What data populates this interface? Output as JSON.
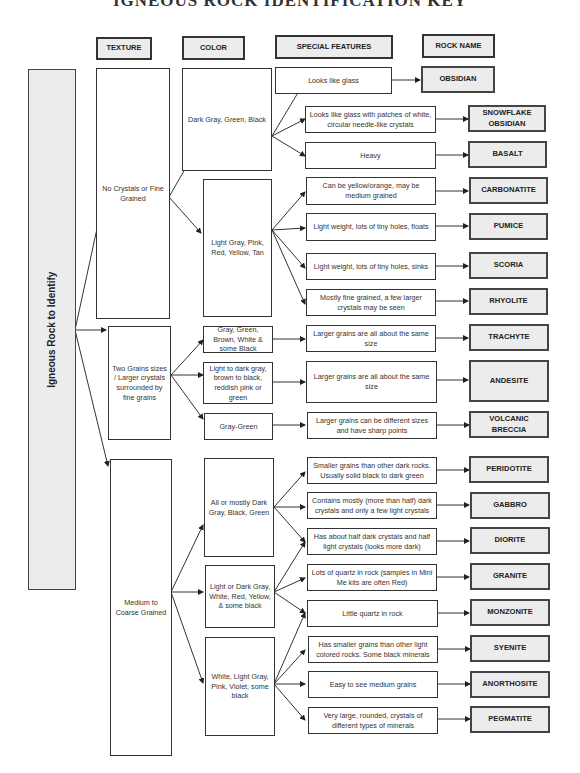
{
  "title": "IGNEOUS ROCK IDENTIFICATION KEY",
  "headers": {
    "texture": "TEXTURE",
    "color": "COLOR",
    "special_features": "SPECIAL FEATURES",
    "rock_name": "ROCK NAME"
  },
  "root": "Igneous Rock to Identify",
  "textures": [
    {
      "label": "No Crystals or Fine Grained"
    },
    {
      "label": "Two Grains sizes / Larger crystals surrounded by fine grains"
    },
    {
      "label": "Medium to Coarse Grained"
    }
  ],
  "colors": [
    {
      "label": "Dark Gray, Green, Black",
      "texture": 0
    },
    {
      "label": "Light Gray, Pink, Red, Yellow, Tan",
      "texture": 0
    },
    {
      "label": "Gray, Green, Brown, White & some Black",
      "texture": 1
    },
    {
      "label": "Light to dark gray, brown to black, reddish pink or green",
      "texture": 1
    },
    {
      "label": "Gray-Green",
      "texture": 1
    },
    {
      "label": "All or mostly Dark Gray, Black, Green",
      "texture": 2
    },
    {
      "label": "Light or Dark Gray, White, Red, Yellow, & some black",
      "texture": 2
    },
    {
      "label": "White, Light Gray, Pink, Violet, some black",
      "texture": 2
    }
  ],
  "features": [
    {
      "label": "Looks like glass",
      "rock": "OBSIDIAN"
    },
    {
      "label": "Looks like glass with patches of white, circular needle-like crystals",
      "rock": "SNOWFLAKE OBSIDIAN"
    },
    {
      "label": "Heavy",
      "rock": "BASALT"
    },
    {
      "label": "Can be yellow/orange, may be medium grained",
      "rock": "CARBONATITE"
    },
    {
      "label": "Light weight, lots of tiny holes, floats",
      "rock": "PUMICE"
    },
    {
      "label": "Light weight, lots of tiny holes, sinks",
      "rock": "SCORIA"
    },
    {
      "label": "Mostly fine grained, a few larger crystals may be seen",
      "rock": "RHYOLITE"
    },
    {
      "label": "Larger grains are all about the same size",
      "rock": "TRACHYTE"
    },
    {
      "label": "Larger grains are all about the same size",
      "rock": "ANDESITE"
    },
    {
      "label": "Larger grains can be different sizes and have sharp points",
      "rock": "VOLCANIC BRECCIA"
    },
    {
      "label": "Smaller grains than other dark rocks. Usually solid black to dark green",
      "rock": "PERIDOTITE"
    },
    {
      "label": "Contains mostly (more than half) dark crystals and only a few light crystals",
      "rock": "GABBRO"
    },
    {
      "label": "Has about half dark crystals and half light crystals (looks more dark)",
      "rock": "DIORITE"
    },
    {
      "label": "Lots of quartz in rock (samples in Mini Me kits are often Red)",
      "rock": "GRANITE"
    },
    {
      "label": "Little quartz in rock",
      "rock": "MONZONITE"
    },
    {
      "label": "Has smaller grains than other light colored rocks.  Some black minerals",
      "rock": "SYENITE"
    },
    {
      "label": "Easy to see medium grains",
      "rock": "ANORTHOSITE"
    },
    {
      "label": "Very large, rounded, crystals of different types of minerals",
      "rock": "PEGMATITE"
    }
  ]
}
